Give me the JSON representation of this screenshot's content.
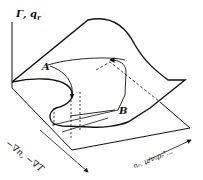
{
  "figure": {
    "type": "3D fold/catastrophe surface diagram",
    "axes": {
      "vertical": "Γ, q_r",
      "front_left": "−∇n, −∇T",
      "right": "n_e, μ/ν_e ρ_e²..."
    },
    "points": {
      "a": "A",
      "b": "B"
    },
    "colors": {
      "line": "#111111",
      "background": "#ffffff"
    }
  },
  "labels": {
    "z_axis": "Γ, q",
    "z_axis_sub": "r",
    "x_axis": "−∇n, −∇T",
    "y_axis": "nₑ, μ/νₑρₑ²...",
    "point_a": "A",
    "point_b": "B"
  }
}
